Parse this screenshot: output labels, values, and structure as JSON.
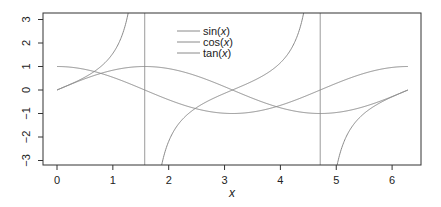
{
  "chart_data": {
    "type": "line",
    "title": "",
    "xlabel": "x",
    "ylabel": "",
    "xlim": [
      -0.25,
      6.53
    ],
    "ylim": [
      -3.25,
      3.25
    ],
    "x_ticks": [
      0,
      1,
      2,
      3,
      4,
      5,
      6
    ],
    "y_ticks": [
      -3,
      -2,
      -1,
      0,
      1,
      2,
      3
    ],
    "grid": false,
    "legend_position": "top-center",
    "series": [
      {
        "name": "sin(x)",
        "function": "sin",
        "x_range": [
          0,
          6.2832
        ],
        "color": "#8a8a8a"
      },
      {
        "name": "cos(x)",
        "function": "cos",
        "x_range": [
          0,
          6.2832
        ],
        "color": "#8a8a8a"
      },
      {
        "name": "tan(x)",
        "function": "tan",
        "x_range": [
          0,
          6.2832
        ],
        "color": "#8a8a8a"
      }
    ],
    "vertical_lines": [
      {
        "x": 1.5708,
        "label": "pi/2"
      },
      {
        "x": 4.7124,
        "label": "3pi/2"
      }
    ],
    "sample_points": {
      "x": [
        0,
        0.5,
        1,
        1.5,
        2,
        2.5,
        3,
        3.5,
        4,
        4.5,
        5,
        5.5,
        6,
        6.28
      ],
      "sin": [
        0,
        0.48,
        0.84,
        1.0,
        0.91,
        0.6,
        0.14,
        -0.35,
        -0.76,
        -0.98,
        -0.96,
        -0.71,
        -0.28,
        0
      ],
      "cos": [
        1,
        0.88,
        0.54,
        0.07,
        -0.42,
        -0.8,
        -0.99,
        -0.94,
        -0.65,
        -0.21,
        0.28,
        0.71,
        0.96,
        1
      ],
      "tan": [
        0,
        0.55,
        1.56,
        14.1,
        -2.19,
        -0.75,
        -0.14,
        0.37,
        1.16,
        4.64,
        -3.38,
        -0.99,
        -0.29,
        0
      ]
    }
  },
  "legend": {
    "items": [
      {
        "label": "sin(x)"
      },
      {
        "label": "cos(x)"
      },
      {
        "label": "tan(x)"
      }
    ]
  },
  "axes": {
    "xlabel": "x",
    "x_tick_labels": [
      "0",
      "1",
      "2",
      "3",
      "4",
      "5",
      "6"
    ],
    "y_tick_labels": [
      "-3",
      "-2",
      "-1",
      "0",
      "1",
      "2",
      "3"
    ]
  },
  "style": {
    "line_color": "#8a8a8a",
    "box_color": "#333333",
    "vline_color": "#9a9a9a"
  }
}
